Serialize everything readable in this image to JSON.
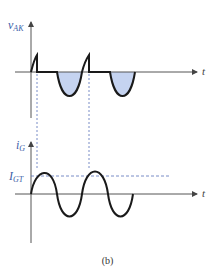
{
  "figure": {
    "caption": "(b)",
    "colors": {
      "axis": "#555555",
      "waveform": "#1a1a1a",
      "shade": "#c5d3f0",
      "dashed": "#5570b8",
      "label": "#3b5ea8"
    }
  },
  "top_plot": {
    "y_label_main": "v",
    "y_label_sub": "AK",
    "x_label": "t",
    "description": "Anode-cathode voltage of SCR: short positive ramps cut off at firing, flat conduction, then shaded negative half-cycles"
  },
  "bottom_plot": {
    "y_label_main": "i",
    "y_label_sub": "G",
    "x_label": "t",
    "threshold_main": "I",
    "threshold_sub": "GT",
    "description": "Sinusoidal gate current with dashed gate-trigger threshold I_GT"
  }
}
